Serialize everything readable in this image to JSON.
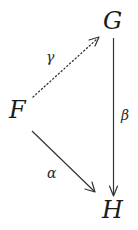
{
  "diagram": {
    "type": "commutative-diagram",
    "nodes": {
      "F": {
        "label": "F",
        "x": 18,
        "y": 110
      },
      "G": {
        "label": "G",
        "x": 113,
        "y": 21
      },
      "H": {
        "label": "H",
        "x": 114,
        "y": 210
      }
    },
    "arrows": [
      {
        "id": "gamma",
        "from": "F",
        "to": "G",
        "label": "γ",
        "style": "dotted"
      },
      {
        "id": "beta",
        "from": "G",
        "to": "H",
        "label": "β",
        "style": "solid"
      },
      {
        "id": "alpha",
        "from": "F",
        "to": "H",
        "label": "α",
        "style": "solid"
      }
    ],
    "colors": {
      "ink": "#1a1a1a",
      "background": "#ffffff"
    }
  }
}
